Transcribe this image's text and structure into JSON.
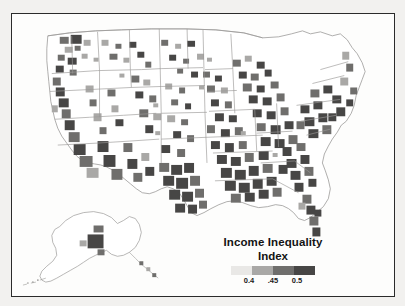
{
  "figure": {
    "kind": "choropleth-map",
    "region": "United States counties with Alaska inset",
    "frame_color": "#2b2b2b",
    "background": "#fdfdfc",
    "page_background": "#f2f1ef"
  },
  "legend": {
    "title_line1": "Income Inequality",
    "title_line2": "Index",
    "swatches": [
      {
        "label": "lowest",
        "color": "#e9e8e6"
      },
      {
        "label": "low-mid",
        "color": "#a9a8a6"
      },
      {
        "label": "mid-high",
        "color": "#6f6e6c"
      },
      {
        "label": "highest",
        "color": "#474645"
      }
    ],
    "ticks": [
      {
        "label": "0.4",
        "pos_pct": 26
      },
      {
        "label": ".45",
        "pos_pct": 50
      },
      {
        "label": "0.5",
        "pos_pct": 74
      }
    ]
  },
  "chart_data": {
    "type": "heatmap",
    "title": "Income Inequality Index",
    "subtitle": "",
    "xlabel": "",
    "ylabel": "",
    "grid": false,
    "legend_position": "bottom-right inside frame",
    "colorscale": [
      "#e9e8e6",
      "#a9a8a6",
      "#6f6e6c",
      "#474645"
    ],
    "value_range": [
      0.35,
      0.55
    ],
    "tick_values": [
      0.4,
      0.45,
      0.5
    ],
    "tick_labels": [
      "0.4",
      ".45",
      "0.5"
    ],
    "units": "Gini-style index",
    "geography": "US counties",
    "insets": [
      "Alaska"
    ],
    "regions": [
      {
        "name": "Northeast corridor",
        "level": "highest",
        "value": 0.52
      },
      {
        "name": "Southeast / Mississippi Delta",
        "level": "highest",
        "value": 0.51
      },
      {
        "name": "Southern Texas",
        "level": "highest",
        "value": 0.51
      },
      {
        "name": "Coastal California",
        "level": "mid-high",
        "value": 0.48
      },
      {
        "name": "Florida peninsula",
        "level": "mid-high",
        "value": 0.48
      },
      {
        "name": "Great Lakes urban",
        "level": "mid-high",
        "value": 0.47
      },
      {
        "name": "Great Plains",
        "level": "lowest",
        "value": 0.4
      },
      {
        "name": "Northern Rockies",
        "level": "lowest",
        "value": 0.4
      },
      {
        "name": "Upper Midwest rural",
        "level": "low-mid",
        "value": 0.43
      },
      {
        "name": "Alaska interior",
        "level": "mid-high",
        "value": 0.47
      }
    ]
  }
}
